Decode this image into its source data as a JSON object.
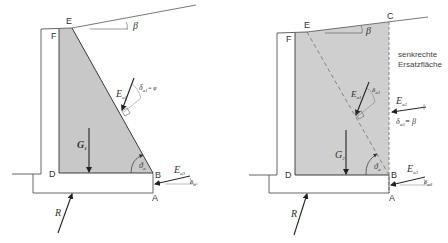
{
  "left_panel": {
    "points": {
      "E": "E",
      "F": "F",
      "D": "D",
      "B": "B",
      "A": "A"
    },
    "angles": {
      "beta": "β",
      "theta_a": "ϑ",
      "theta_a_sub": "a",
      "delta_a1": "δ",
      "delta_a1_sub": "a1",
      "delta_a1_eq": "= φ",
      "delta_a3": "δ",
      "delta_a3_sub": "a"
    },
    "forces": {
      "Ea1": "E",
      "Ea1_sub": "a1",
      "Ea3": "E",
      "Ea3_sub": "a3",
      "G1": "G",
      "G1_sub": "1",
      "R": "R"
    }
  },
  "right_panel": {
    "points": {
      "E": "E",
      "F": "F",
      "C": "C",
      "D": "D",
      "B": "B",
      "A": "A"
    },
    "note_line1": "senkrechte",
    "note_line2": "Ersatzfläche",
    "angles": {
      "beta": "β",
      "theta_a": "ϑ",
      "theta_a_sub": "a",
      "delta_a1": "δ",
      "delta_a1_sub": "a1",
      "delta_a2": "δ",
      "delta_a2_sub": "a2",
      "delta_a2_eq": "= β",
      "delta_a3": "δ",
      "delta_a3_sub": "a3"
    },
    "forces": {
      "Ea1": "E",
      "Ea1_sub": "a1",
      "Ea2": "E",
      "Ea2_sub": "a2",
      "Ea3": "E",
      "Ea3_sub": "a3",
      "G2": "G",
      "G2_sub": "2",
      "R": "R"
    }
  },
  "colors": {
    "soil_fill": "#c8c8c8",
    "line": "#3a3a3a",
    "dashed": "#7a7a7a"
  }
}
